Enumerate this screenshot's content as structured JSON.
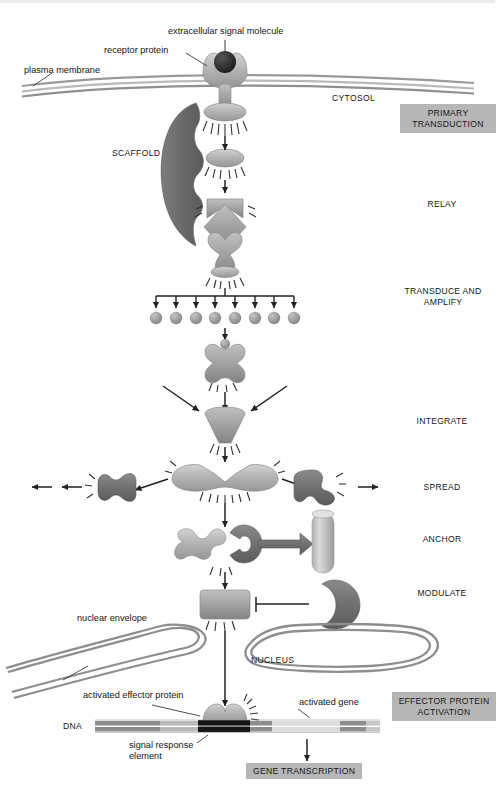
{
  "figure": {
    "colors": {
      "protein_light": "#b9b9b9",
      "protein_mid": "#9d9d9d",
      "protein_dark": "#6f6f6f",
      "scaffold": "#6d6d6d",
      "membrane": "#9a9a9a",
      "ligand": "#2a2a2a",
      "arrow": "#222222",
      "label_box": "#b6b6b6",
      "dna_band_dark": "#1d1d1d",
      "dna_band_mid": "#8d8d8d",
      "dna_band_light": "#d2d2d2",
      "background": "#ffffff"
    }
  },
  "annotations": {
    "extracellular_signal_molecule": "extracellular signal molecule",
    "receptor_protein": "receptor protein",
    "plasma_membrane": "plasma membrane",
    "cytosol": "CYTOSOL",
    "scaffold": "SCAFFOLD",
    "nuclear_envelope": "nuclear envelope",
    "nucleus": "NUCLEUS",
    "activated_effector_protein": "activated effector protein",
    "dna": "DNA",
    "signal_response_element": "signal response\nelement",
    "signal_response_element_line1": "signal response",
    "signal_response_element_line2": "element",
    "activated_gene": "activated gene",
    "gene_transcription": "GENE TRANSCRIPTION"
  },
  "stages": [
    {
      "id": "primary-transduction",
      "label": "PRIMARY\nTRANSDUCTION",
      "boxed": true
    },
    {
      "id": "relay",
      "label": "RELAY",
      "boxed": false
    },
    {
      "id": "transduce-and-amplify",
      "label": "TRANSDUCE AND\nAMPLIFY",
      "boxed": false
    },
    {
      "id": "integrate",
      "label": "INTEGRATE",
      "boxed": false
    },
    {
      "id": "spread",
      "label": "SPREAD",
      "boxed": false
    },
    {
      "id": "anchor",
      "label": "ANCHOR",
      "boxed": false
    },
    {
      "id": "modulate",
      "label": "MODULATE",
      "boxed": false
    },
    {
      "id": "effector-protein-activation",
      "label": "EFFECTOR PROTEIN\nACTIVATION",
      "boxed": true
    }
  ],
  "amplification": {
    "branch_count": 8,
    "description": "Eight branching arrows each terminating on a small second-messenger sphere"
  }
}
